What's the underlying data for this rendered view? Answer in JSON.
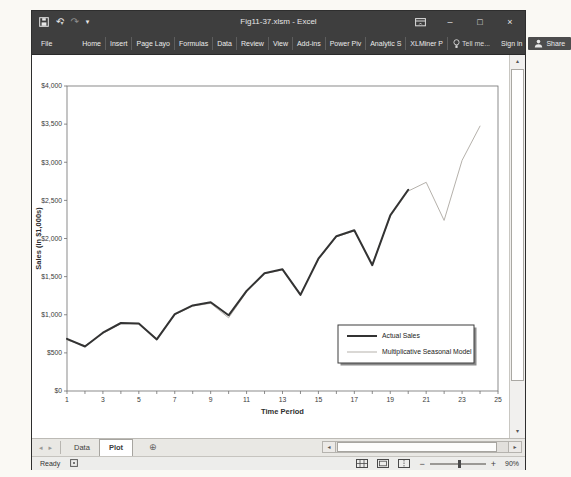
{
  "window": {
    "title": "Fig11-37.xlsm - Excel",
    "controls": {
      "minimize": "–",
      "maximize": "□",
      "close": "×"
    }
  },
  "icons": {
    "save": "floppy-disk",
    "undo": "↶",
    "redo": "↷",
    "qat_dropdown": "▾",
    "undo_dropdown": "▾",
    "ribbon_display": "panel",
    "tell_me": "lightbulb",
    "share": "person",
    "sheet_nav_left": "◂",
    "sheet_nav_right": "▸",
    "add_sheet": "⊕",
    "scroll_up": "▴",
    "scroll_down": "▾",
    "scroll_left": "◂",
    "scroll_right": "▸",
    "zoom_out": "−",
    "zoom_in": "+"
  },
  "ribbon": {
    "tabs": [
      "File",
      "Home",
      "Insert",
      "Page Layo",
      "Formulas",
      "Data",
      "Review",
      "View",
      "Add-ins",
      "Power Piv",
      "Analytic S",
      "XLMiner P"
    ],
    "tell_me": "Tell me...",
    "sign_in": "Sign in",
    "share": "Share"
  },
  "chart_data": {
    "type": "line",
    "title": "",
    "xlabel": "Time Period",
    "ylabel": "Sales (in $1,000s)",
    "xlim": [
      1,
      25
    ],
    "ylim": [
      0,
      4000
    ],
    "ytick_interval": 500,
    "ytick_labels": [
      "$0",
      "$500",
      "$1,000",
      "$1,500",
      "$2,000",
      "$2,500",
      "$3,000",
      "$3,500",
      "$4,000"
    ],
    "xtick_labels": [
      "1",
      "3",
      "5",
      "7",
      "9",
      "11",
      "13",
      "15",
      "17",
      "19",
      "21",
      "23",
      "25"
    ],
    "grid": false,
    "legend_position": "inside-lower-right",
    "series": [
      {
        "name": "Actual Sales",
        "color": "#333333",
        "stroke_width": 2,
        "x": [
          1,
          2,
          3,
          4,
          5,
          6,
          7,
          8,
          9,
          10,
          11,
          12,
          13,
          14,
          15,
          16,
          17,
          18,
          19,
          20
        ],
        "values": [
          684,
          584,
          765,
          892,
          885,
          677,
          1007,
          1122,
          1163,
          993,
          1313,
          1545,
          1596,
          1260,
          1735,
          2030,
          2108,
          1650,
          2304,
          2639
        ]
      },
      {
        "name": "Multiplicative Seasonal Model",
        "color": "#b5b1ab",
        "stroke_width": 1,
        "x": [
          1,
          2,
          3,
          4,
          5,
          6,
          7,
          8,
          9,
          10,
          11,
          12,
          13,
          14,
          15,
          16,
          17,
          18,
          19,
          20,
          21,
          22,
          23,
          24
        ],
        "values": [
          668,
          596,
          754,
          884,
          880,
          688,
          1000,
          1113,
          1150,
          960,
          1298,
          1538,
          1588,
          1272,
          1726,
          2022,
          2098,
          1665,
          2288,
          2622,
          2737,
          2237,
          3026,
          3474
        ]
      }
    ]
  },
  "sheet_bar": {
    "tabs": [
      {
        "label": "Data",
        "active": false
      },
      {
        "label": "Plot",
        "active": true
      }
    ]
  },
  "status_bar": {
    "ready": "Ready",
    "zoom_level": "90%"
  }
}
